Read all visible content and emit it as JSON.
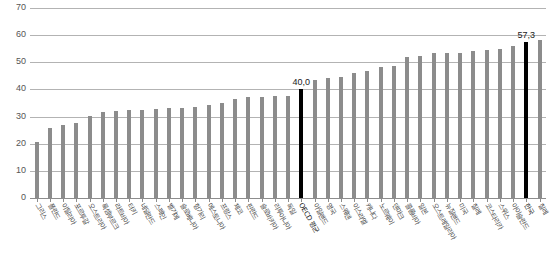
{
  "chart_data": {
    "type": "bar",
    "title": "",
    "subtitle": "",
    "xlabel": "",
    "ylabel": "",
    "ylim": [
      0,
      70
    ],
    "yticks": [
      0,
      10,
      20,
      30,
      40,
      50,
      60,
      70
    ],
    "ytick_labels": [
      "0",
      "10",
      "20",
      "30",
      "40",
      "50",
      "60",
      "70"
    ],
    "grid": true,
    "legend": "none",
    "decimal_separator": ",",
    "highlight_color": "#000000",
    "bar_color": "#8c8c8c",
    "categories": [
      "그리스",
      "폴란드",
      "이탈리아",
      "포르투갈",
      "오스트리아",
      "룩셈부르크",
      "라트비아",
      "터키",
      "네덜란드",
      "스페인",
      "벨기에",
      "슬로베니아",
      "헝가리",
      "에스토니아",
      "프랑스",
      "체코",
      "핀란드",
      "슬로바키아",
      "리투아니아",
      "독일",
      "OECD 평균",
      "아일랜드",
      "영국",
      "스웨덴",
      "이스라엘",
      "캐나다",
      "노르웨이",
      "덴마크",
      "콜롬비아",
      "일본",
      "오스트레일리아",
      "뉴질랜드",
      "미국",
      "칠레",
      "코스타리카",
      "스위스",
      "아이슬란드",
      "한국",
      "칠레"
    ],
    "values": [
      20.8,
      25.9,
      26.9,
      27.5,
      30.1,
      31.6,
      32.1,
      32.3,
      32.6,
      32.8,
      33.0,
      33.2,
      33.5,
      34.2,
      35.0,
      36.6,
      37.2,
      37.4,
      37.6,
      37.7,
      40.0,
      43.6,
      44.4,
      44.6,
      46.0,
      46.9,
      48.4,
      48.6,
      51.9,
      52.5,
      53.3,
      53.4,
      53.6,
      54.1,
      54.5,
      55.0,
      56.0,
      57.3,
      58.3
    ],
    "data_labels": [
      {
        "index": 20,
        "text": "40,0"
      },
      {
        "index": 37,
        "text": "57,3"
      }
    ],
    "highlighted_indices": [
      20,
      37
    ]
  }
}
